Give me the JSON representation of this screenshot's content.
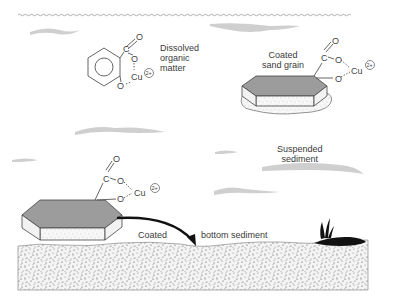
{
  "diagram": {
    "title": "",
    "labels": {
      "dissolved_organic_matter": [
        "Dissolved",
        "organic",
        "matter"
      ],
      "coated_sand_grain": [
        "Coated",
        "sand grain"
      ],
      "suspended_sediment": [
        "Suspended",
        "sediment"
      ],
      "coated_bottom_sediment_left": "Coated",
      "coated_bottom_sediment_right": "bottom sediment"
    },
    "chemistry": {
      "carbon": "C",
      "oxygen": "O",
      "copper": "Cu",
      "charge": "2+"
    },
    "colors": {
      "water_surface": "#9a9a9a",
      "current_streak": "#cfcfcf",
      "grain_top": "#9c9c9c",
      "sediment_dots": "#555555",
      "arrow": "#111111",
      "vegetation": "#111111"
    }
  }
}
